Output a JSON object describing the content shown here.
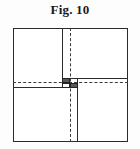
{
  "figure": {
    "caption": "Fig. 10",
    "colors": {
      "line": "#2b2b2b",
      "dash": "#3a3a3a",
      "block_fill_dark": "#595959",
      "block_fill_light": "#ffffff",
      "background": "#ffffff"
    },
    "frame": {
      "label": "outer square frame",
      "x": 13,
      "y": 28,
      "width": 115,
      "height": 114
    },
    "solid_lines": [
      {
        "name": "upper-vertical-partition",
        "orientation": "vertical",
        "pos": 49,
        "from": 0,
        "to": 59
      },
      {
        "name": "lower-vertical-partition",
        "orientation": "vertical",
        "pos": 64,
        "from": 50,
        "to": 114
      },
      {
        "name": "left-horizontal-partition",
        "orientation": "horizontal",
        "pos": 59,
        "from": 0,
        "to": 65
      },
      {
        "name": "right-horizontal-partition",
        "orientation": "horizontal",
        "pos": 50,
        "from": 49,
        "to": 115
      }
    ],
    "dashed_lines": [
      {
        "name": "vertical-centre-line",
        "orientation": "vertical",
        "pos": 57
      },
      {
        "name": "horizontal-centre-line",
        "orientation": "horizontal",
        "pos": 54
      }
    ],
    "detail_blocks": [
      {
        "name": "upper-left-block",
        "fill": "dark",
        "x": 49,
        "y": 50,
        "width": 8,
        "height": 4
      },
      {
        "name": "lower-left-block",
        "fill": "light",
        "x": 49,
        "y": 54,
        "width": 8,
        "height": 5
      },
      {
        "name": "lower-right-block",
        "fill": "dark",
        "x": 57,
        "y": 54,
        "width": 8,
        "height": 5
      }
    ]
  }
}
